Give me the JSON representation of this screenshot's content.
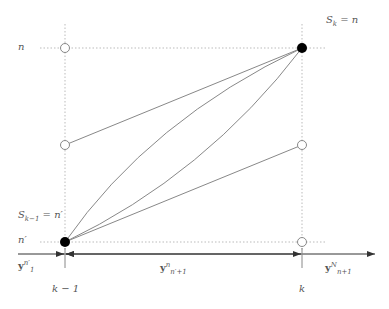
{
  "labels": {
    "n": "n",
    "n_prime": "n′",
    "s_k": "S",
    "s_k_sub": "k",
    "s_k_eq": " = n",
    "s_km1": "S",
    "s_km1_sub": "k−1",
    "s_km1_eq": " = n′",
    "y1_base": "y",
    "y1_sup": "n′",
    "y1_sub": "1",
    "ymid_base": "y",
    "ymid_sup": "n",
    "ymid_sub": "n′+1",
    "yright_base": "y",
    "yright_sup": "N",
    "yright_sub": "n+1",
    "k_minus_1": "k − 1",
    "k": "k"
  },
  "colors": {
    "line": "#888888",
    "dotted": "#bbbbbb",
    "filled_node": "#000000",
    "text": "#555555"
  },
  "nodes": [
    {
      "id": "left-top",
      "x": 65,
      "y": 48,
      "filled": false
    },
    {
      "id": "left-mid",
      "x": 65,
      "y": 145,
      "filled": false
    },
    {
      "id": "left-bottom",
      "x": 65,
      "y": 242,
      "filled": true
    },
    {
      "id": "right-top",
      "x": 302,
      "y": 48,
      "filled": true
    },
    {
      "id": "right-mid",
      "x": 302,
      "y": 145,
      "filled": false
    },
    {
      "id": "right-bottom",
      "x": 302,
      "y": 242,
      "filled": false
    }
  ]
}
